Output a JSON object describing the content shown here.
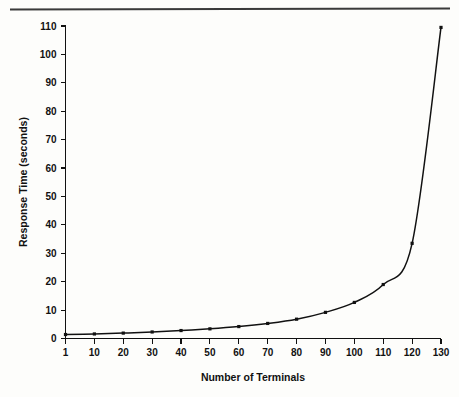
{
  "figure": {
    "top_rule_visible": true,
    "background_color": "#fdfdfb",
    "ink_color": "#111111"
  },
  "chart_data": {
    "type": "line",
    "title": "",
    "subtitle": "",
    "xlabel": "Number of Terminals",
    "ylabel": "Response Time (seconds)",
    "categories": [
      1,
      10,
      20,
      30,
      40,
      50,
      60,
      70,
      80,
      90,
      100,
      110,
      120,
      130
    ],
    "x_tick_labels": [
      "1",
      "10",
      "20",
      "30",
      "40",
      "50",
      "60",
      "70",
      "80",
      "90",
      "100",
      "110",
      "120",
      "130"
    ],
    "y_tick_labels": [
      "0",
      "10",
      "20",
      "30",
      "40",
      "50",
      "60",
      "70",
      "80",
      "90",
      "100",
      "110"
    ],
    "y_ticks": [
      0,
      10,
      20,
      30,
      40,
      50,
      60,
      70,
      80,
      90,
      100,
      110
    ],
    "values": [
      1.4,
      1.6,
      1.9,
      2.3,
      2.8,
      3.4,
      4.2,
      5.3,
      6.8,
      9.2,
      12.7,
      19.0,
      33.5,
      109.5
    ],
    "series": [
      {
        "name": "Response Time",
        "values": [
          1.4,
          1.6,
          1.9,
          2.3,
          2.8,
          3.4,
          4.2,
          5.3,
          6.8,
          9.2,
          12.7,
          19.0,
          33.5,
          109.5
        ],
        "marker": "square",
        "color": "#111111"
      }
    ],
    "ylim": [
      0,
      110
    ],
    "xlim_categorical": true,
    "grid": false,
    "legend": false,
    "legend_position": "none",
    "line_color": "#111111",
    "marker_color": "#111111"
  }
}
